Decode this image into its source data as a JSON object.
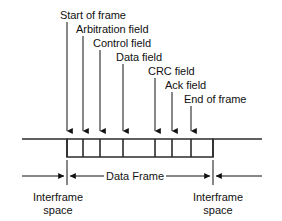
{
  "diagram": {
    "colors": {
      "background": "#ffffff",
      "stroke": "#111111",
      "waveform": "#2b2b2b"
    },
    "field_labels": [
      {
        "id": "start-of-frame",
        "text": "Start of frame",
        "x": 60,
        "y": 10,
        "leader_x": 67,
        "leader_top": 22,
        "arrow_y": 131
      },
      {
        "id": "arbitration-field",
        "text": "Arbitration field",
        "x": 76,
        "y": 24,
        "leader_x": 83,
        "leader_top": 36,
        "arrow_y": 131
      },
      {
        "id": "control-field",
        "text": "Control field",
        "x": 93,
        "y": 38,
        "leader_x": 100,
        "leader_top": 50,
        "arrow_y": 131
      },
      {
        "id": "data-field",
        "text": "Data field",
        "x": 116,
        "y": 52,
        "leader_x": 123,
        "leader_top": 64,
        "arrow_y": 131
      },
      {
        "id": "crc-field",
        "text": "CRC field",
        "x": 148,
        "y": 66,
        "leader_x": 155,
        "leader_top": 78,
        "arrow_y": 131
      },
      {
        "id": "ack-field",
        "text": "Ack field",
        "x": 165,
        "y": 80,
        "leader_x": 172,
        "leader_top": 92,
        "arrow_y": 131
      },
      {
        "id": "end-of-frame",
        "text": "End of frame",
        "x": 184,
        "y": 94,
        "leader_x": 191,
        "leader_top": 106,
        "arrow_y": 131
      }
    ],
    "waveform": {
      "high_y": 139,
      "low_y": 157,
      "left_start_x": 22,
      "frame_start_x": 67,
      "frame_end_x": 213,
      "right_end_x": 262,
      "dividers_x": [
        67,
        83,
        100,
        123,
        155,
        172,
        191,
        213
      ]
    },
    "dimensions": [
      {
        "id": "interframe-space-left",
        "label_line1": "Interframe",
        "label_line2": "space",
        "label_x": 12,
        "label_y": 191,
        "arrow_from_x": 22,
        "arrow_to_x": 64,
        "y": 176
      },
      {
        "id": "data-frame",
        "label_line1": "Data Frame",
        "label_line2": "",
        "label_x": 104,
        "label_y": 170,
        "arrow_from_x": 70,
        "arrow_to_x": 210,
        "y": 176
      },
      {
        "id": "interframe-space-right",
        "label_line1": "Interframe",
        "label_line2": "space",
        "label_x": 172,
        "label_y": 191,
        "arrow_from_x": 262,
        "arrow_to_x": 216,
        "y": 176
      }
    ],
    "boundary_marks_x": [
      67,
      213
    ],
    "boundary_mark_top": 160,
    "boundary_mark_bottom": 185
  }
}
